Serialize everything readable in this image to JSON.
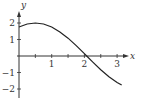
{
  "chart_data": {
    "type": "line",
    "title": "",
    "xlabel": "x",
    "ylabel": "y",
    "xlim": [
      0,
      3.3
    ],
    "ylim": [
      -2.3,
      2.6
    ],
    "grid": false,
    "legend": null,
    "x_ticks": [
      0.5,
      1,
      1.5,
      2,
      2.5,
      3
    ],
    "x_tick_labels": [
      "1",
      "2",
      "3"
    ],
    "x_tick_label_values": [
      1,
      2,
      3
    ],
    "y_ticks": [
      -2,
      -1,
      1,
      2
    ],
    "y_tick_labels": [
      "2",
      "1",
      "-1",
      "-2"
    ],
    "y_tick_label_values": [
      2,
      1,
      -1,
      -2
    ],
    "series": [
      {
        "name": "curve",
        "x": [
          0,
          0.25,
          0.5,
          0.75,
          1,
          1.25,
          1.5,
          1.75,
          2,
          2.07,
          2.25,
          2.5,
          2.75,
          3,
          3.14
        ],
        "values": [
          1.76,
          1.94,
          2.0,
          1.94,
          1.76,
          1.46,
          1.08,
          0.63,
          0.14,
          0.0,
          -0.36,
          -0.83,
          -1.26,
          -1.6,
          -1.76
        ]
      }
    ]
  },
  "axes": {
    "x_label": "x",
    "y_label": "y"
  }
}
